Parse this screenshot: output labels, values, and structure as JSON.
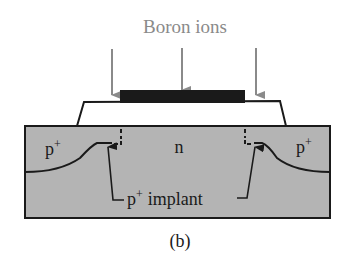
{
  "diagram": {
    "title": "Boron ions",
    "caption": "(b)",
    "regions": {
      "left_region": "p",
      "left_region_sup": "+",
      "center_region": "n",
      "right_region": "p",
      "right_region_sup": "+"
    },
    "annotation": {
      "prefix": "p",
      "sup": "+",
      "text": "implant"
    },
    "colors": {
      "substrate": "#b4b4b4",
      "gate": "#1a1a1a",
      "oxide": "#ffffff",
      "arrow": "#8a8a8a",
      "title": "#8a8a8a",
      "line": "#1a1a1a"
    },
    "arrows_count": 3
  }
}
